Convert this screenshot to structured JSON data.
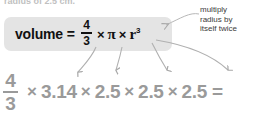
{
  "page": {
    "width": 264,
    "height": 120,
    "background": "#ffffff"
  },
  "cutoff_header": {
    "text": "radius of 2.5 cm."
  },
  "formula": {
    "label": "volume",
    "equals": "=",
    "fraction": {
      "numerator": "4",
      "denominator": "3"
    },
    "times_1": "×",
    "pi": "π",
    "times_2": "×",
    "variable": "r",
    "exponent": "3",
    "box_color": "#e4e4e4",
    "text_color": "#111111"
  },
  "callout": {
    "lines": [
      "multiply",
      "radius by",
      "itself twice"
    ],
    "color": "#3b3b3b"
  },
  "worked": {
    "fraction": {
      "numerator": "4",
      "denominator": "3"
    },
    "times_1": "×",
    "pi_value": "3.14",
    "times_2": "×",
    "radius_1": "2.5",
    "times_3": "×",
    "radius_2": "2.5",
    "times_4": "×",
    "radius_3": "2.5",
    "equals": "=",
    "color": "#9a9a9a"
  },
  "arrows": {
    "color": "#b0b0b0",
    "leader_color": "#b8b8b8",
    "count": 4,
    "descriptions": [
      "fraction-four-thirds-to-four-thirds",
      "pi-to-3.14",
      "r-to-first-2.5",
      "r-cubed-to-last-2.5"
    ]
  }
}
